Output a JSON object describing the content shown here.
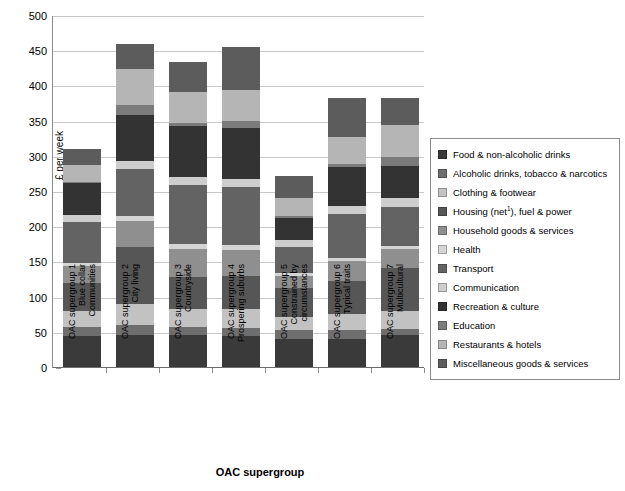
{
  "axes": {
    "ylabel": "£ per week",
    "xlabel": "OAC supergroup",
    "yticks": [
      "500",
      "450",
      "400",
      "350",
      "300",
      "250",
      "200",
      "150",
      "100",
      "50",
      "0"
    ]
  },
  "legend": {
    "items": [
      {
        "label": "Food & non-alcoholic drinks",
        "color": "#3a3a3a",
        "has_sup": false
      },
      {
        "label": "Alcoholic drinks, tobacco & narcotics",
        "color": "#6e6e6e",
        "has_sup": false
      },
      {
        "label": "Clothing & footwear",
        "color": "#c2c2c2",
        "has_sup": false
      },
      {
        "label": "Housing (net",
        "sup": "1",
        "label_tail": "), fuel & power",
        "color": "#565656",
        "has_sup": true
      },
      {
        "label": "Household goods & services",
        "color": "#8f8f8f",
        "has_sup": false
      },
      {
        "label": "Health",
        "color": "#d4d4d4",
        "has_sup": false
      },
      {
        "label": "Transport",
        "color": "#636363",
        "has_sup": false
      },
      {
        "label": "Communication",
        "color": "#cdcdcd",
        "has_sup": false
      },
      {
        "label": "Recreation & culture",
        "color": "#333333",
        "has_sup": false
      },
      {
        "label": "Education",
        "color": "#7b7b7b",
        "has_sup": false
      },
      {
        "label": "Restaurants & hotels",
        "color": "#b5b5b5",
        "has_sup": false
      },
      {
        "label": "Miscellaneous goods & services",
        "color": "#5c5c5c",
        "has_sup": false
      }
    ]
  },
  "xlabels": [
    {
      "line1": "OAC supergroup 1",
      "line2": "Blue collar",
      "line3": "Communities"
    },
    {
      "line1": "OAC supergroup 2",
      "line2": "City living",
      "line3": ""
    },
    {
      "line1": "OAC supergroup 3",
      "line2": "Countryside",
      "line3": ""
    },
    {
      "line1": "OAC supergroup 4",
      "line2": "Prospering suburbs",
      "line3": ""
    },
    {
      "line1": "OAC supergroup 5",
      "line2": "Constrained by",
      "line3": "circumstances"
    },
    {
      "line1": "OAC supergroup 6",
      "line2": "Typical traits",
      "line3": ""
    },
    {
      "line1": "OAC supergroup 7",
      "line2": "Multicultural",
      "line3": ""
    }
  ],
  "chart_data": {
    "type": "bar",
    "subtype": "stacked",
    "title": "",
    "xlabel": "OAC supergroup",
    "ylabel": "£ per week",
    "ylim": [
      0,
      500
    ],
    "ytick_step": 50,
    "grid": true,
    "legend_position": "right",
    "categories": [
      "OAC supergroup 1 Blue collar Communities",
      "OAC supergroup 2 City living",
      "OAC supergroup 3 Countryside",
      "OAC supergroup 4 Prospering suburbs",
      "OAC supergroup 5 Constrained by circumstances",
      "OAC supergroup 6 Typical traits",
      "OAC supergroup 7 Multicultural"
    ],
    "series": [
      {
        "name": "Food & non-alcoholic drinks",
        "color": "#3a3a3a",
        "values": [
          44,
          46,
          45,
          44,
          40,
          40,
          46
        ]
      },
      {
        "name": "Alcoholic drinks, tobacco & narcotics",
        "color": "#6e6e6e",
        "values": [
          13,
          13,
          12,
          11,
          13,
          12,
          8
        ]
      },
      {
        "name": "Clothing & footwear",
        "color": "#c2c2c2",
        "values": [
          22,
          31,
          26,
          28,
          18,
          23,
          25
        ]
      },
      {
        "name": "Housing (net1), fuel & power",
        "color": "#565656",
        "values": [
          41,
          80,
          45,
          47,
          41,
          47,
          62
        ]
      },
      {
        "name": "Household goods & services",
        "color": "#8f8f8f",
        "values": [
          24,
          38,
          39,
          36,
          18,
          28,
          27
        ]
      },
      {
        "name": "Health",
        "color": "#d4d4d4",
        "values": [
          4,
          6,
          8,
          8,
          3,
          5,
          4
        ]
      },
      {
        "name": "Transport",
        "color": "#636363",
        "values": [
          58,
          67,
          84,
          82,
          38,
          63,
          55
        ]
      },
      {
        "name": "Communication",
        "color": "#cdcdcd",
        "values": [
          10,
          12,
          11,
          11,
          9,
          11,
          13
        ]
      },
      {
        "name": "Recreation & culture",
        "color": "#333333",
        "values": [
          45,
          65,
          72,
          73,
          32,
          55,
          46
        ]
      },
      {
        "name": "Education",
        "color": "#7b7b7b",
        "values": [
          2,
          15,
          5,
          9,
          2,
          5,
          12
        ]
      },
      {
        "name": "Restaurants & hotels",
        "color": "#b5b5b5",
        "values": [
          24,
          50,
          44,
          45,
          26,
          38,
          46
        ]
      },
      {
        "name": "Miscellaneous goods & services",
        "color": "#5c5c5c",
        "values": [
          23,
          36,
          43,
          61,
          31,
          55,
          38
        ]
      }
    ],
    "totals": [
      310,
      459,
      434,
      455,
      271,
      382,
      382
    ]
  }
}
